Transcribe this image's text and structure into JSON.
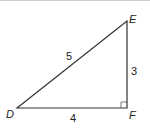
{
  "diagram": {
    "type": "right-triangle",
    "vertices": [
      {
        "name": "D",
        "x": 17,
        "y": 107
      },
      {
        "name": "E",
        "x": 127,
        "y": 20
      },
      {
        "name": "F",
        "x": 127,
        "y": 107
      }
    ],
    "sides": [
      {
        "from": "D",
        "to": "E",
        "label": "5"
      },
      {
        "from": "E",
        "to": "F",
        "label": "3"
      },
      {
        "from": "D",
        "to": "F",
        "label": "4"
      }
    ],
    "right_angle_at": "F",
    "labels": {
      "D": "D",
      "E": "E",
      "F": "F",
      "DE": "5",
      "EF": "3",
      "DF": "4"
    },
    "colors": {
      "line": "#333333",
      "text": "#222222"
    }
  }
}
